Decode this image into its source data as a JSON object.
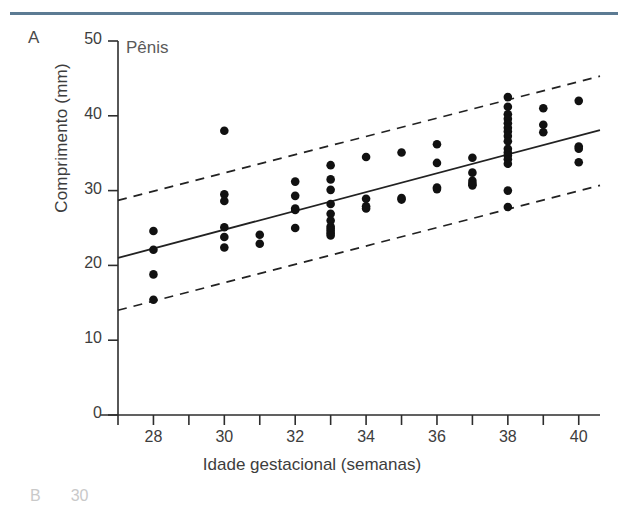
{
  "figure": {
    "panel_label": "A",
    "title": "Pênis",
    "rule_color": "#5c7b93"
  },
  "next_panel_fragment": {
    "label": "B",
    "tick": "30"
  },
  "chart_data": {
    "type": "scatter",
    "title": "Pênis",
    "xlabel": "Idade gestacional (semanas)",
    "ylabel": "Comprimento (mm)",
    "xlim": [
      27,
      40.6
    ],
    "ylim": [
      0,
      50
    ],
    "grid": false,
    "legend": "none",
    "xticks": [
      27,
      28,
      29,
      30,
      31,
      32,
      33,
      34,
      35,
      36,
      37,
      38,
      39,
      40
    ],
    "xticklabels": [
      "",
      "28",
      "",
      "30",
      "",
      "32",
      "",
      "34",
      "",
      "36",
      "",
      "38",
      "",
      "40"
    ],
    "yticks": [
      0,
      10,
      20,
      30,
      40,
      50
    ],
    "yticklabels": [
      "0",
      "10",
      "20",
      "30",
      "40",
      "50"
    ],
    "marker_color": "#111111",
    "line_color": "#222222",
    "series": [
      {
        "name": "Observações",
        "marker": "filled-circle",
        "x": [
          28,
          28,
          28,
          28,
          30,
          30,
          30,
          30,
          30,
          30,
          31,
          31,
          32,
          32,
          32,
          32,
          32,
          33,
          33,
          33,
          33,
          33,
          33,
          33,
          33,
          33,
          33,
          33,
          34,
          34,
          34,
          34,
          35,
          35,
          35,
          36,
          36,
          36,
          36,
          37,
          37,
          37,
          37,
          37,
          38,
          38,
          38,
          38,
          38,
          38,
          38,
          38,
          38,
          38,
          38,
          38,
          38,
          38,
          38,
          38,
          39,
          39,
          39,
          40,
          40,
          40,
          40
        ],
        "y": [
          24.6,
          22.1,
          18.8,
          15.4,
          38.0,
          29.5,
          28.6,
          25.1,
          23.8,
          22.4,
          24.1,
          22.9,
          31.2,
          29.3,
          27.6,
          27.4,
          25.0,
          33.4,
          31.5,
          30.1,
          28.2,
          26.9,
          26.0,
          25.2,
          24.9,
          24.6,
          24.3,
          24.0,
          34.5,
          28.9,
          27.9,
          27.6,
          35.1,
          29.0,
          28.8,
          36.2,
          33.7,
          30.4,
          30.2,
          34.4,
          32.4,
          31.3,
          30.9,
          30.7,
          42.5,
          41.2,
          40.2,
          39.6,
          39.0,
          38.4,
          37.9,
          37.3,
          36.6,
          35.6,
          35.1,
          34.7,
          34.2,
          33.6,
          30.0,
          27.8,
          41.0,
          38.8,
          37.8,
          42.0,
          35.9,
          35.6,
          33.8
        ]
      }
    ],
    "fit_line": {
      "name": "Regressão linear",
      "style": "solid",
      "x": [
        27,
        40.6
      ],
      "y": [
        21.0,
        38.1
      ]
    },
    "reference_bands": [
      {
        "name": "Limite superior",
        "style": "dashed",
        "x": [
          27,
          40.6
        ],
        "y": [
          28.7,
          45.3
        ]
      },
      {
        "name": "Limite inferior",
        "style": "dashed",
        "x": [
          27,
          40.6
        ],
        "y": [
          14.0,
          30.7
        ]
      }
    ]
  }
}
